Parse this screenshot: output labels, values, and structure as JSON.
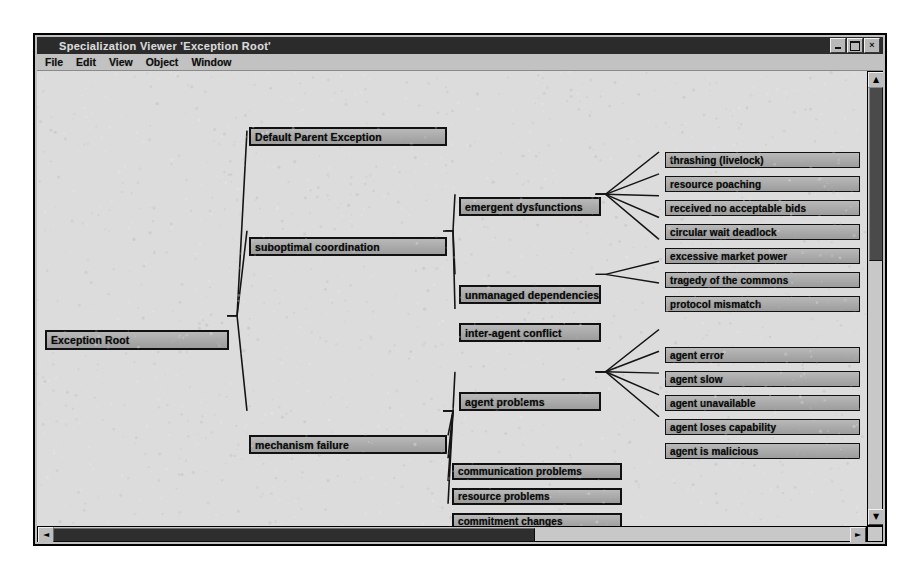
{
  "window": {
    "title": "Specialization Viewer 'Exception Root'",
    "controls": {
      "minimize": "_",
      "maximize": "□",
      "close": "×"
    }
  },
  "menubar": {
    "items": [
      {
        "label": "File"
      },
      {
        "label": "Edit"
      },
      {
        "label": "View"
      },
      {
        "label": "Object"
      },
      {
        "label": "Window"
      }
    ]
  },
  "scrollbars": {
    "horizontal": {
      "left_arrow": "◄",
      "right_arrow": "►",
      "thumb_percent": 58
    },
    "vertical": {
      "up_arrow": "▲",
      "down_arrow": "▼",
      "thumb_percent": 38
    }
  },
  "tree": {
    "root": "Exception Root",
    "nodes": [
      {
        "id": "n0",
        "label": "Exception Root",
        "x": 8,
        "y": 259,
        "w": 184,
        "h": 20,
        "level": 0
      },
      {
        "id": "n1",
        "label": "Default Parent Exception",
        "x": 212,
        "y": 56,
        "w": 198,
        "h": 19,
        "level": 1
      },
      {
        "id": "n2",
        "label": "suboptimal coordination",
        "x": 212,
        "y": 166,
        "w": 198,
        "h": 19,
        "level": 1
      },
      {
        "id": "n3",
        "label": "mechanism failure",
        "x": 212,
        "y": 364,
        "w": 198,
        "h": 19,
        "level": 1
      },
      {
        "id": "n4",
        "label": "emergent dysfunctions",
        "x": 422,
        "y": 126,
        "w": 142,
        "h": 19,
        "level": 2
      },
      {
        "id": "n5",
        "label": "unmanaged dependencies",
        "x": 422,
        "y": 214,
        "w": 142,
        "h": 19,
        "level": 2
      },
      {
        "id": "n6",
        "label": "inter-agent conflict",
        "x": 422,
        "y": 252,
        "w": 142,
        "h": 19,
        "level": 2
      },
      {
        "id": "n7",
        "label": "agent problems",
        "x": 422,
        "y": 321,
        "w": 142,
        "h": 19,
        "level": 2
      },
      {
        "id": "n8",
        "label": "communication problems",
        "x": 415,
        "y": 392,
        "w": 170,
        "h": 17,
        "level": 2
      },
      {
        "id": "n9",
        "label": "resource problems",
        "x": 415,
        "y": 417,
        "w": 170,
        "h": 17,
        "level": 2
      },
      {
        "id": "n10",
        "label": "commitment changes",
        "x": 415,
        "y": 442,
        "w": 170,
        "h": 17,
        "level": 2
      },
      {
        "id": "n11",
        "label": "missed opportunities",
        "x": 415,
        "y": 467,
        "w": 170,
        "h": 17,
        "level": 2
      },
      {
        "id": "n12",
        "label": "thrashing (livelock)",
        "x": 628,
        "y": 81,
        "w": 195,
        "h": 16,
        "level": 3
      },
      {
        "id": "n13",
        "label": "resource poaching",
        "x": 628,
        "y": 105,
        "w": 195,
        "h": 16,
        "level": 3
      },
      {
        "id": "n14",
        "label": "received no acceptable bids",
        "x": 628,
        "y": 129,
        "w": 195,
        "h": 16,
        "level": 3
      },
      {
        "id": "n15",
        "label": "circular wait deadlock",
        "x": 628,
        "y": 153,
        "w": 195,
        "h": 16,
        "level": 3
      },
      {
        "id": "n16",
        "label": "excessive market power",
        "x": 628,
        "y": 177,
        "w": 195,
        "h": 16,
        "level": 3
      },
      {
        "id": "n17",
        "label": "tragedy of the commons",
        "x": 628,
        "y": 201,
        "w": 195,
        "h": 16,
        "level": 3
      },
      {
        "id": "n18",
        "label": "protocol mismatch",
        "x": 628,
        "y": 225,
        "w": 195,
        "h": 16,
        "level": 3
      },
      {
        "id": "n19",
        "label": "agent error",
        "x": 628,
        "y": 276,
        "w": 195,
        "h": 16,
        "level": 3
      },
      {
        "id": "n20",
        "label": "agent slow",
        "x": 628,
        "y": 300,
        "w": 195,
        "h": 16,
        "level": 3
      },
      {
        "id": "n21",
        "label": "agent unavailable",
        "x": 628,
        "y": 324,
        "w": 195,
        "h": 16,
        "level": 3
      },
      {
        "id": "n22",
        "label": "agent loses capability",
        "x": 628,
        "y": 348,
        "w": 195,
        "h": 16,
        "level": 3
      },
      {
        "id": "n23",
        "label": "agent is malicious",
        "x": 628,
        "y": 372,
        "w": 195,
        "h": 16,
        "level": 3
      }
    ],
    "edges": [
      {
        "from": "n0",
        "to": "n1"
      },
      {
        "from": "n0",
        "to": "n2"
      },
      {
        "from": "n0",
        "to": "n3"
      },
      {
        "from": "n2",
        "to": "n4"
      },
      {
        "from": "n2",
        "to": "n5"
      },
      {
        "from": "n2",
        "to": "n6"
      },
      {
        "from": "n3",
        "to": "n7"
      },
      {
        "from": "n3",
        "to": "n8"
      },
      {
        "from": "n3",
        "to": "n9"
      },
      {
        "from": "n3",
        "to": "n10"
      },
      {
        "from": "n3",
        "to": "n11"
      },
      {
        "from": "n4",
        "to": "n12"
      },
      {
        "from": "n4",
        "to": "n13"
      },
      {
        "from": "n4",
        "to": "n14"
      },
      {
        "from": "n4",
        "to": "n15"
      },
      {
        "from": "n4",
        "to": "n16"
      },
      {
        "from": "n5",
        "to": "n17"
      },
      {
        "from": "n5",
        "to": "n18"
      },
      {
        "from": "n7",
        "to": "n19"
      },
      {
        "from": "n7",
        "to": "n20"
      },
      {
        "from": "n7",
        "to": "n21"
      },
      {
        "from": "n7",
        "to": "n22"
      },
      {
        "from": "n7",
        "to": "n23"
      }
    ]
  },
  "colors": {
    "node_fill": "#a9a9a9",
    "node_border": "#111111",
    "canvas_bg": "#dcdcdc",
    "window_chrome": "#c0c0c0",
    "titlebar_bg": "#2b2b2b",
    "titlebar_text": "#d8d8d8"
  }
}
